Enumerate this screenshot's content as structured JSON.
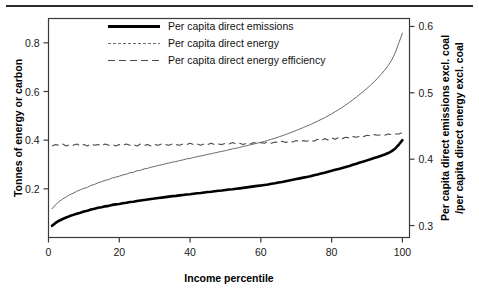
{
  "chart_data": {
    "type": "line",
    "title": "",
    "xlabel": "Income percentile",
    "ylabel": "Tonnes of energy or carbon",
    "y2label": "Per capita direct emissions excl. coal /per capita direct energy excl. coal",
    "y2label_line1": "Per capita direct emissions excl. coal",
    "y2label_line2": "/per capita direct energy excl. coal",
    "xlim": [
      0,
      102
    ],
    "ylim": [
      0,
      0.9
    ],
    "y2lim": [
      0.282,
      0.612
    ],
    "xticks": [
      0,
      20,
      40,
      60,
      80,
      100
    ],
    "xticklabels": [
      "0",
      "20",
      "40",
      "60",
      "80",
      "100"
    ],
    "yticks": [
      0.2,
      0.4,
      0.6,
      0.8
    ],
    "yticklabels": [
      "0.2",
      "0.4",
      "0.6",
      "0.8"
    ],
    "y2ticks": [
      0.3,
      0.4,
      0.5,
      0.6
    ],
    "y2ticklabels": [
      "0.3",
      "0.4",
      "0.5",
      "0.6"
    ],
    "grid": false,
    "legend_position": "top-center",
    "x": [
      1,
      2,
      3,
      4,
      5,
      6,
      7,
      8,
      9,
      10,
      11,
      12,
      13,
      14,
      15,
      16,
      17,
      18,
      19,
      20,
      21,
      22,
      23,
      24,
      25,
      26,
      27,
      28,
      29,
      30,
      31,
      32,
      33,
      34,
      35,
      36,
      37,
      38,
      39,
      40,
      41,
      42,
      43,
      44,
      45,
      46,
      47,
      48,
      49,
      50,
      51,
      52,
      53,
      54,
      55,
      56,
      57,
      58,
      59,
      60,
      61,
      62,
      63,
      64,
      65,
      66,
      67,
      68,
      69,
      70,
      71,
      72,
      73,
      74,
      75,
      76,
      77,
      78,
      79,
      80,
      81,
      82,
      83,
      84,
      85,
      86,
      87,
      88,
      89,
      90,
      91,
      92,
      93,
      94,
      95,
      96,
      97,
      98,
      99,
      100
    ],
    "series": [
      {
        "name": "Per capita direct emissions",
        "axis": "left",
        "style": "solid-thick",
        "color": "#000000",
        "values": [
          0.048,
          0.06,
          0.069,
          0.076,
          0.082,
          0.088,
          0.093,
          0.098,
          0.102,
          0.107,
          0.11,
          0.115,
          0.118,
          0.122,
          0.124,
          0.128,
          0.13,
          0.134,
          0.136,
          0.138,
          0.141,
          0.143,
          0.146,
          0.147,
          0.15,
          0.152,
          0.154,
          0.156,
          0.158,
          0.16,
          0.162,
          0.164,
          0.166,
          0.168,
          0.17,
          0.171,
          0.173,
          0.175,
          0.177,
          0.178,
          0.18,
          0.182,
          0.183,
          0.185,
          0.187,
          0.188,
          0.19,
          0.192,
          0.193,
          0.195,
          0.197,
          0.198,
          0.2,
          0.202,
          0.204,
          0.206,
          0.208,
          0.21,
          0.212,
          0.214,
          0.216,
          0.218,
          0.221,
          0.223,
          0.226,
          0.228,
          0.231,
          0.234,
          0.237,
          0.24,
          0.243,
          0.246,
          0.249,
          0.252,
          0.256,
          0.259,
          0.263,
          0.266,
          0.27,
          0.274,
          0.278,
          0.282,
          0.286,
          0.29,
          0.294,
          0.299,
          0.303,
          0.308,
          0.312,
          0.317,
          0.322,
          0.327,
          0.331,
          0.336,
          0.341,
          0.347,
          0.355,
          0.366,
          0.382,
          0.4
        ]
      },
      {
        "name": "Per capita direct energy",
        "axis": "left",
        "style": "solid-thin",
        "color": "#6b6b6b",
        "values": [
          0.118,
          0.135,
          0.148,
          0.158,
          0.167,
          0.176,
          0.182,
          0.19,
          0.196,
          0.202,
          0.206,
          0.214,
          0.218,
          0.225,
          0.229,
          0.235,
          0.238,
          0.245,
          0.248,
          0.252,
          0.257,
          0.26,
          0.266,
          0.268,
          0.274,
          0.276,
          0.282,
          0.284,
          0.289,
          0.292,
          0.296,
          0.299,
          0.303,
          0.306,
          0.31,
          0.312,
          0.316,
          0.319,
          0.323,
          0.325,
          0.329,
          0.332,
          0.335,
          0.338,
          0.342,
          0.344,
          0.348,
          0.351,
          0.354,
          0.357,
          0.361,
          0.364,
          0.367,
          0.37,
          0.374,
          0.377,
          0.381,
          0.384,
          0.388,
          0.391,
          0.395,
          0.399,
          0.404,
          0.408,
          0.413,
          0.418,
          0.423,
          0.429,
          0.434,
          0.44,
          0.446,
          0.452,
          0.458,
          0.464,
          0.471,
          0.478,
          0.485,
          0.492,
          0.5,
          0.508,
          0.517,
          0.526,
          0.535,
          0.545,
          0.555,
          0.566,
          0.577,
          0.589,
          0.601,
          0.613,
          0.626,
          0.64,
          0.655,
          0.671,
          0.688,
          0.707,
          0.73,
          0.76,
          0.8,
          0.84
        ]
      },
      {
        "name": "Per capita direct energy efficiency",
        "axis": "right",
        "style": "dashed",
        "color": "#4a4a4a",
        "values": [
          0.42,
          0.422,
          0.421,
          0.423,
          0.42,
          0.422,
          0.421,
          0.423,
          0.42,
          0.422,
          0.42,
          0.423,
          0.421,
          0.422,
          0.42,
          0.423,
          0.421,
          0.422,
          0.42,
          0.422,
          0.421,
          0.423,
          0.421,
          0.422,
          0.42,
          0.423,
          0.421,
          0.422,
          0.42,
          0.422,
          0.421,
          0.423,
          0.422,
          0.421,
          0.423,
          0.422,
          0.421,
          0.423,
          0.422,
          0.424,
          0.422,
          0.423,
          0.421,
          0.423,
          0.422,
          0.424,
          0.422,
          0.423,
          0.422,
          0.424,
          0.423,
          0.425,
          0.423,
          0.424,
          0.422,
          0.424,
          0.423,
          0.425,
          0.423,
          0.425,
          0.424,
          0.426,
          0.424,
          0.426,
          0.425,
          0.427,
          0.425,
          0.427,
          0.426,
          0.428,
          0.426,
          0.428,
          0.427,
          0.429,
          0.427,
          0.43,
          0.428,
          0.431,
          0.429,
          0.432,
          0.43,
          0.433,
          0.431,
          0.433,
          0.432,
          0.434,
          0.433,
          0.435,
          0.434,
          0.436,
          0.435,
          0.437,
          0.436,
          0.437,
          0.436,
          0.438,
          0.437,
          0.438,
          0.438,
          0.44
        ]
      }
    ],
    "legend": [
      {
        "label": "Per capita direct emissions",
        "style": "solid-thick"
      },
      {
        "label": "Per capita direct energy",
        "style": "dotted-thin"
      },
      {
        "label": "Per capita direct energy efficiency",
        "style": "dashed"
      }
    ]
  }
}
